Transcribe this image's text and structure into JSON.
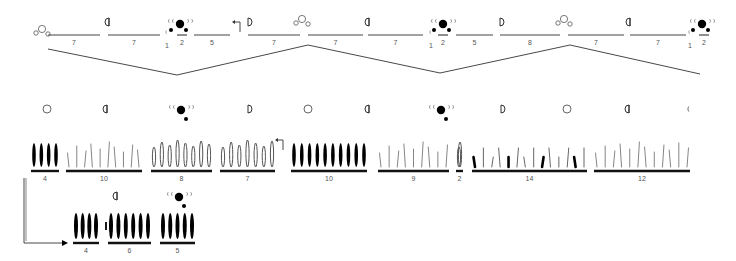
{
  "diagram": {
    "top_row": {
      "segments": [
        {
          "label": "7",
          "x1": 48,
          "x2": 100
        },
        {
          "label": "7",
          "x1": 108,
          "x2": 160
        },
        {
          "label": "2",
          "x1": 177,
          "x2": 187
        },
        {
          "label": "5",
          "x1": 194,
          "x2": 230
        },
        {
          "label": "7",
          "x1": 248,
          "x2": 300
        },
        {
          "label": "7",
          "x1": 308,
          "x2": 363
        },
        {
          "label": "7",
          "x1": 368,
          "x2": 423
        },
        {
          "label": "2",
          "x1": 438,
          "x2": 448
        },
        {
          "label": "5",
          "x1": 456,
          "x2": 493
        },
        {
          "label": "8",
          "x1": 500,
          "x2": 560
        },
        {
          "label": "7",
          "x1": 568,
          "x2": 624
        },
        {
          "label": "7",
          "x1": 630,
          "x2": 686
        },
        {
          "label": "2",
          "x1": 699,
          "x2": 709
        }
      ],
      "markers_one": [
        {
          "label": "1",
          "x": 167
        },
        {
          "label": "1",
          "x": 431
        },
        {
          "label": "1",
          "x": 690
        }
      ],
      "phase_symbols": [
        {
          "type": "full-moon-cluster",
          "x": 46
        },
        {
          "type": "first-quarter",
          "x": 107
        },
        {
          "type": "new-moon-cluster",
          "x": 176
        },
        {
          "type": "arrow-up-left",
          "x": 240
        },
        {
          "type": "last-quarter",
          "x": 248
        },
        {
          "type": "full-moon-cluster",
          "x": 306
        },
        {
          "type": "first-quarter",
          "x": 367
        },
        {
          "type": "new-moon-cluster",
          "x": 439
        },
        {
          "type": "last-quarter",
          "x": 500
        },
        {
          "type": "full-moon-cluster",
          "x": 568
        },
        {
          "type": "first-quarter",
          "x": 628
        },
        {
          "type": "new-moon-cluster",
          "x": 698
        }
      ],
      "zigzag": [
        [
          48,
          49
        ],
        [
          177,
          75
        ],
        [
          308,
          45
        ],
        [
          440,
          73
        ],
        [
          570,
          45
        ],
        [
          700,
          74
        ]
      ]
    },
    "middle_row": {
      "groups": [
        {
          "label": "4",
          "x1": 31,
          "x2": 59,
          "style": "thick"
        },
        {
          "label": "10",
          "x1": 66,
          "x2": 142,
          "style": "thin"
        },
        {
          "label": "8",
          "x1": 151,
          "x2": 212,
          "style": "loops"
        },
        {
          "label": "7",
          "x1": 220,
          "x2": 275,
          "style": "loops"
        },
        {
          "label": "10",
          "x1": 291,
          "x2": 367,
          "style": "thick"
        },
        {
          "label": "9",
          "x1": 378,
          "x2": 449,
          "style": "thin"
        },
        {
          "label": "2",
          "x1": 456,
          "x2": 463,
          "style": "loops"
        },
        {
          "label": "14",
          "x1": 472,
          "x2": 587,
          "style": "mixed"
        },
        {
          "label": "12",
          "x1": 594,
          "x2": 690,
          "style": "thin"
        }
      ],
      "phase_symbols": [
        {
          "type": "full-moon",
          "x": 47
        },
        {
          "type": "first-quarter",
          "x": 105
        },
        {
          "type": "new-moon-cluster",
          "x": 180
        },
        {
          "type": "last-quarter",
          "x": 248
        },
        {
          "type": "full-moon",
          "x": 308
        },
        {
          "type": "first-quarter",
          "x": 367
        },
        {
          "type": "new-moon-cluster",
          "x": 440
        },
        {
          "type": "last-quarter",
          "x": 501
        },
        {
          "type": "full-moon",
          "x": 567
        },
        {
          "type": "first-quarter",
          "x": 627
        },
        {
          "type": "crescent",
          "x": 689
        }
      ]
    },
    "bottom_row": {
      "groups": [
        {
          "label": "4",
          "x1": 73,
          "x2": 99
        },
        {
          "label": "6",
          "x1": 108,
          "x2": 151
        },
        {
          "label": "5",
          "x1": 160,
          "x2": 195
        }
      ],
      "phase_symbols": [
        {
          "type": "first-quarter",
          "x": 115
        },
        {
          "type": "new-moon-cluster",
          "x": 178
        }
      ]
    },
    "connector": {
      "type": "arrow-from-row2-to-row3"
    }
  }
}
